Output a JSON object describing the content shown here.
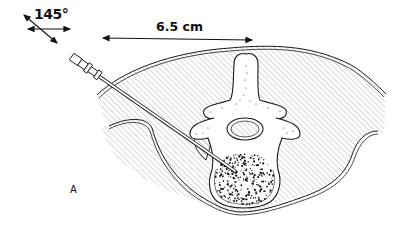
{
  "figure": {
    "panel_label": "A",
    "angle_annotation": "145°",
    "distance_annotation": "6.5 cm",
    "parts": [
      "needle-hub",
      "needle-shaft",
      "skin-outline",
      "paraspinal-muscle-hatched",
      "spinous-process",
      "lamina",
      "transverse-processes",
      "spinal-canal",
      "vertebral-body-stippled",
      "psoas-muscles"
    ],
    "colors": {
      "line": "#1a1a1a",
      "hatch": "#9a9a9a",
      "background": "#ffffff"
    }
  }
}
